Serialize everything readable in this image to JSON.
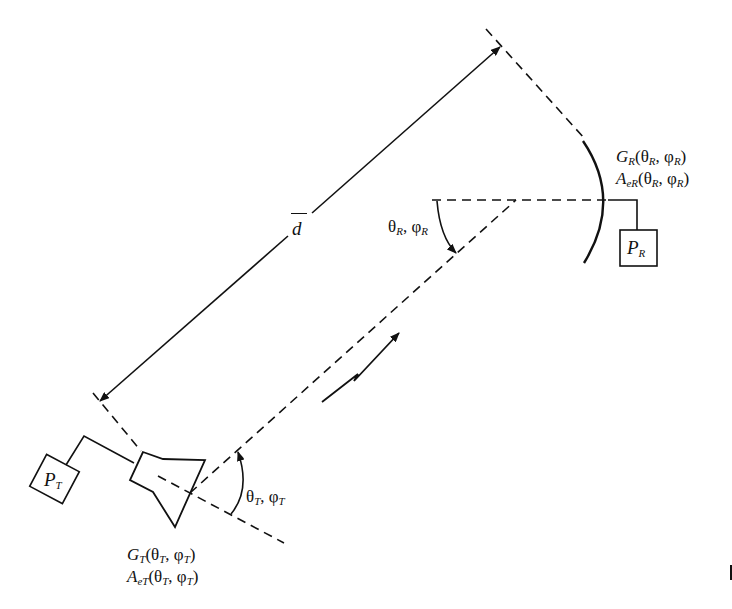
{
  "diagram": {
    "distance_label": "d",
    "receiver": {
      "gain_label_main": "G",
      "gain_sub": "R",
      "gain_args": "(θ_R, φ_R)",
      "aperture_label_main": "A",
      "aperture_sub": "eR",
      "aperture_args": "(θ_R, φ_R)",
      "power_main": "P",
      "power_sub": "R",
      "angle_label": "θ_R, φ_R"
    },
    "transmitter": {
      "gain_label_main": "G",
      "gain_sub": "T",
      "gain_args": "(θ_T, φ_T)",
      "aperture_label_main": "A",
      "aperture_sub": "eT",
      "aperture_args": "(θ_T, φ_T)",
      "power_main": "P",
      "power_sub": "T",
      "angle_label": "θ_T, φ_T"
    },
    "stroke_color": "#111111",
    "edge_mark": "I"
  }
}
